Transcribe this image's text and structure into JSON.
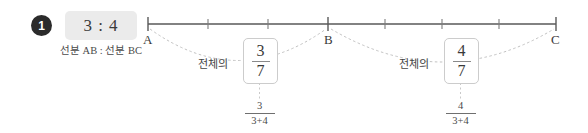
{
  "left_panel": {
    "badge_number": "1",
    "ratio_value": "3 : 4",
    "caption": "선분 AB : 선분 BC"
  },
  "number_line": {
    "points": [
      {
        "id": "A",
        "label": "A"
      },
      {
        "id": "B",
        "label": "B"
      },
      {
        "id": "C",
        "label": "C"
      }
    ],
    "segment_ab_ticks": 3,
    "segment_bc_ticks": 4,
    "total_ticks": 7
  },
  "annotations": [
    {
      "whole_label": "전체의",
      "fraction_numerator": "3",
      "fraction_denominator": "7",
      "expression_numerator": "3",
      "expression_denominator": "3+4"
    },
    {
      "whole_label": "전체의",
      "fraction_numerator": "4",
      "fraction_denominator": "7",
      "expression_numerator": "4",
      "expression_denominator": "3+4"
    }
  ],
  "colors": {
    "badge_bg": "#2b2b2b",
    "ratio_box_bg": "#ebebeb",
    "line": "#595959",
    "dotted": "#bdbdbd",
    "box_border": "#cccccc",
    "text": "#3a3a3a"
  }
}
